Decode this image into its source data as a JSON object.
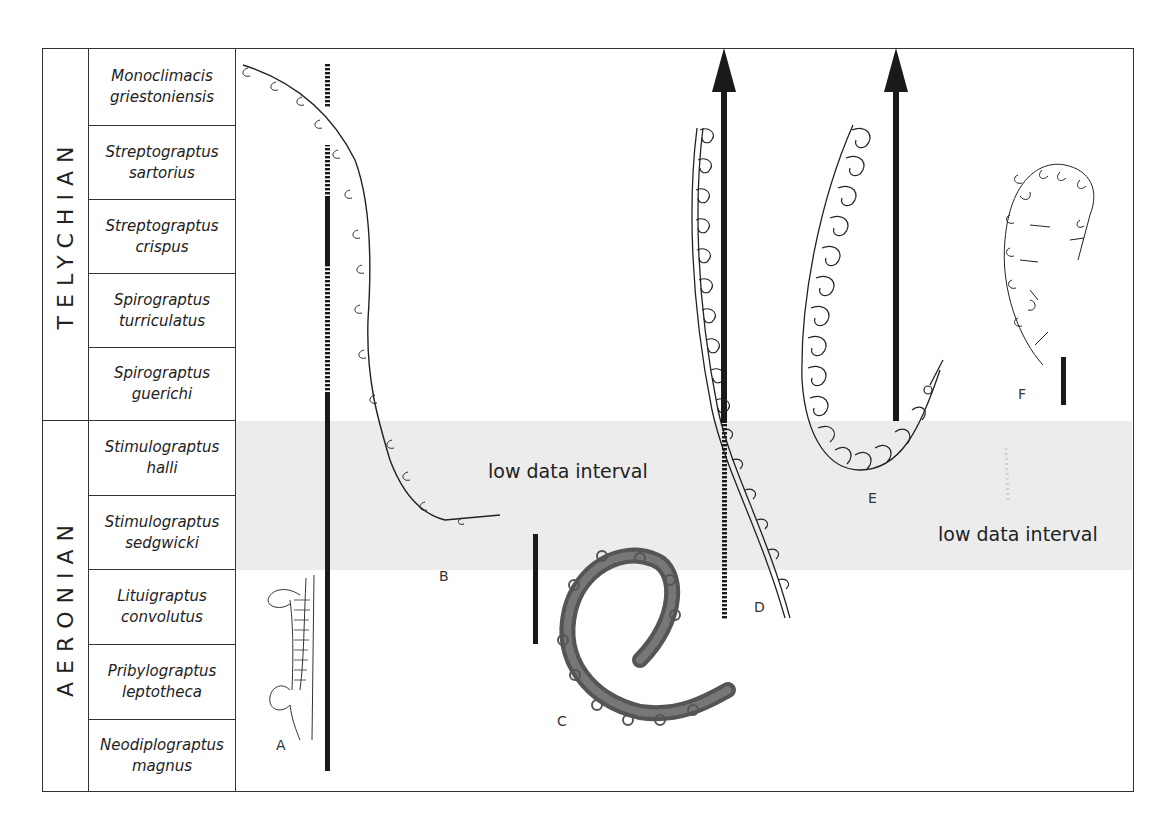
{
  "stages": [
    {
      "name": "TELYCHIAN"
    },
    {
      "name": "AERONIAN"
    }
  ],
  "zones": [
    {
      "genus": "Monoclimacis",
      "species": "griestoniensis"
    },
    {
      "genus": "Streptograptus",
      "species": "sartorius"
    },
    {
      "genus": "Streptograptus",
      "species": "crispus"
    },
    {
      "genus": "Spirograptus",
      "species": "turriculatus"
    },
    {
      "genus": "Spirograptus",
      "species": "guerichi"
    },
    {
      "genus": "Stimulograptus",
      "species": "halli"
    },
    {
      "genus": "Stimulograptus",
      "species": "sedgwicki"
    },
    {
      "genus": "Lituigraptus",
      "species": "convolutus"
    },
    {
      "genus": "Pribylograptus",
      "species": "leptotheca"
    },
    {
      "genus": "Neodiplograptus",
      "species": "magnus"
    }
  ],
  "annotations": {
    "low_data_interval_1": "low data interval",
    "low_data_interval_2": "low data interval"
  },
  "specimens": {
    "A": "A",
    "B": "B",
    "C": "C",
    "D": "D",
    "E": "E",
    "F": "F"
  },
  "colors": {
    "band": "#ececec",
    "ink": "#1a1a1a",
    "frame": "#333333"
  }
}
